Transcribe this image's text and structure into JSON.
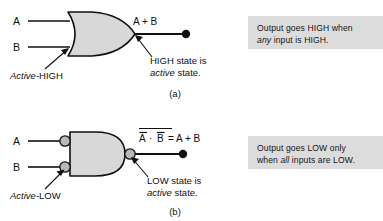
{
  "figure": {
    "title_a": "(a)",
    "title_b": "(b)",
    "panel_a": {
      "gate_type": "OR gate (active-HIGH inputs, active-HIGH output)",
      "input_labels": [
        "A",
        "B"
      ],
      "output_expression": "A + B",
      "input_annotation_italic": "Active",
      "input_annotation_rest": "-HIGH",
      "output_annotation_line1": "HIGH state is",
      "output_annotation_line2_italic": "active",
      "output_annotation_line2_rest": " state.",
      "callout_line1": "Output goes HIGH when",
      "callout_line2_italic": "any",
      "callout_line2_rest": " input is HIGH."
    },
    "panel_b": {
      "gate_type": "NAND gate drawn as OR with inverted inputs (active-LOW inputs, active-LOW output)",
      "input_labels": [
        "A",
        "B"
      ],
      "output_expression_overbar_outer": "A · B",
      "output_expression_terms": [
        "A",
        "·",
        "B"
      ],
      "output_expression_equals": "= A + B",
      "input_annotation_italic": "Active",
      "input_annotation_rest": "-LOW",
      "output_annotation_line1": "LOW state is",
      "output_annotation_line2_italic": "active",
      "output_annotation_line2_rest": " state.",
      "callout_line1": "Output goes LOW only",
      "callout_line2_pre": "when ",
      "callout_line2_italic": "all",
      "callout_line2_rest": " inputs are LOW."
    },
    "colors": {
      "gate_fill": "#d8d8d8",
      "bubble_fill": "#b8b8b8",
      "line": "#101010",
      "callout_bg": "#dcdcdc",
      "page_bg": "#ffffff"
    }
  }
}
